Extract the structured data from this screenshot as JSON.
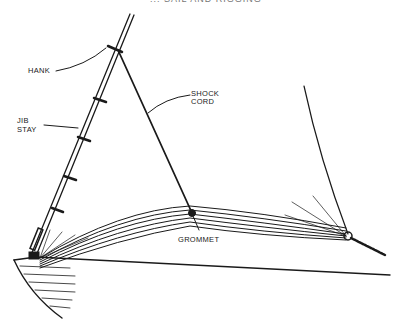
{
  "title_partial": "... SAIL AND RIGGING",
  "labels": {
    "hank": "HANK",
    "jib_stay_line1": "JIB",
    "jib_stay_line2": "STAY",
    "shock_cord_line1": "SHOCK",
    "shock_cord_line2": "CORD",
    "grommet": "GROMMET"
  },
  "colors": {
    "ink": "#1a1a1a",
    "background": "#ffffff"
  }
}
